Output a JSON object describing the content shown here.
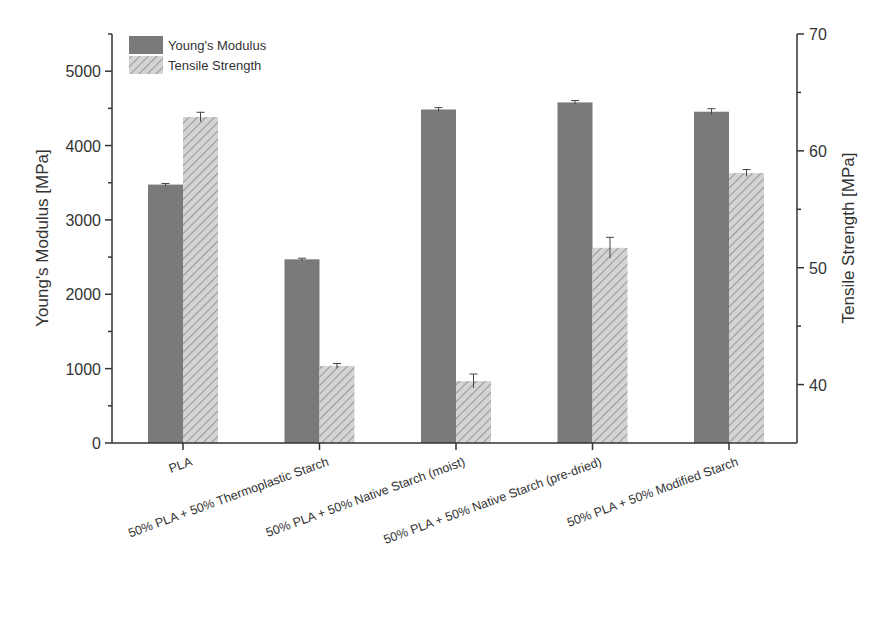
{
  "chart_data": {
    "type": "bar",
    "title": "",
    "categories": [
      "PLA",
      "50% PLA + 50% Thermoplastic Starch",
      "50% PLA + 50% Native Starch (moist)",
      "50% PLA + 50% Native Starch (pre-dried)",
      "50% PLA + 50% Modified Starch"
    ],
    "series": [
      {
        "name": "Young's Modulus",
        "axis": "left",
        "pattern": "solid",
        "color": "#7a7a7a",
        "values": [
          3475,
          2470,
          4485,
          4580,
          4455
        ],
        "errors": [
          15,
          15,
          25,
          25,
          40
        ]
      },
      {
        "name": "Tensile Strength",
        "axis": "right",
        "pattern": "hatched",
        "color": "#c8c8c8",
        "values": [
          62.9,
          41.6,
          40.3,
          51.7,
          58.1
        ],
        "errors": [
          0.4,
          0.2,
          0.6,
          0.9,
          0.3
        ]
      }
    ],
    "xlabel": "",
    "ylabel": "Young's Modulus [MPa]",
    "y2label": "Tensile Strength [MPa]",
    "ylim": [
      0,
      5500
    ],
    "y2lim": [
      35,
      70
    ],
    "yticks": [
      0,
      1000,
      2000,
      3000,
      4000,
      5000
    ],
    "y2ticks": [
      40,
      50,
      60,
      70
    ],
    "grid": false,
    "legend_position": "top-left"
  },
  "legend": {
    "items": [
      "Young's Modulus",
      "Tensile Strength"
    ]
  },
  "axes": {
    "left_title": "Young's Modulus [MPa]",
    "right_title": "Tensile Strength [MPa]"
  }
}
